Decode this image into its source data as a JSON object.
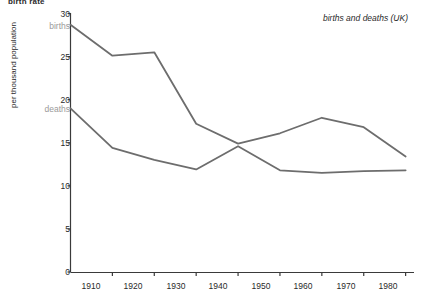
{
  "figure": {
    "title": "birth rate",
    "caption": "births and deaths (UK)"
  },
  "chart_data": {
    "type": "line",
    "title": "birth rate",
    "subtitle": "births and deaths (UK)",
    "xlabel": "",
    "ylabel": "per thousand population",
    "xlim": [
      1900,
      1982
    ],
    "ylim": [
      0,
      30
    ],
    "xticks": [
      1910,
      1920,
      1930,
      1940,
      1950,
      1960,
      1970,
      1980
    ],
    "xtick_labels": [
      "1910",
      "1920",
      "1930",
      "1940",
      "1950",
      "1960",
      "1970",
      "1980"
    ],
    "yticks": [
      0,
      5,
      10,
      15,
      20,
      25,
      30
    ],
    "ytick_labels": [
      "0",
      "5",
      "10",
      "15",
      "20",
      "25",
      "30"
    ],
    "grid": false,
    "legend": "inline-labels",
    "x": [
      1900,
      1910,
      1920,
      1930,
      1940,
      1950,
      1960,
      1970,
      1980
    ],
    "series": [
      {
        "name": "births",
        "color": "#6d6d6d",
        "values": [
          28.7,
          25.1,
          25.5,
          17.2,
          14.9,
          16.1,
          17.9,
          16.8,
          13.4
        ]
      },
      {
        "name": "deaths",
        "color": "#6d6d6d",
        "values": [
          19.0,
          14.4,
          13.0,
          11.9,
          14.6,
          11.8,
          11.5,
          11.7,
          11.8
        ]
      }
    ],
    "annotations": [
      {
        "text": "births",
        "x": 1900,
        "y": 28.7,
        "color": "#9a9a9a"
      },
      {
        "text": "deaths",
        "x": 1900,
        "y": 19.0,
        "color": "#9a9a9a"
      }
    ]
  },
  "axis": {
    "y_ticks": [
      {
        "label": "30",
        "top": 9
      },
      {
        "label": "25",
        "top": 52
      },
      {
        "label": "20",
        "top": 95
      },
      {
        "label": "15",
        "top": 138
      },
      {
        "label": "10",
        "top": 181
      },
      {
        "label": "5",
        "top": 224
      },
      {
        "label": "0",
        "top": 267
      }
    ],
    "x_ticks": [
      {
        "label": "1910",
        "left": 91
      },
      {
        "label": "1920",
        "left": 133
      },
      {
        "label": "1930",
        "left": 176
      },
      {
        "label": "1940",
        "left": 218
      },
      {
        "label": "1950",
        "left": 261
      },
      {
        "label": "1960",
        "left": 303
      },
      {
        "label": "1970",
        "left": 346
      },
      {
        "label": "1980",
        "left": 388
      }
    ]
  },
  "series_labels": [
    {
      "text": "births",
      "left": 28,
      "top": 21
    },
    {
      "text": "deaths",
      "left": 28,
      "top": 104
    }
  ]
}
